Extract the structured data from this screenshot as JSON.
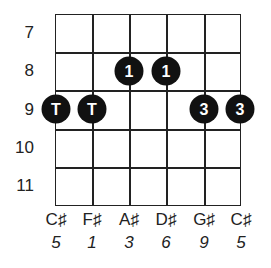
{
  "diagram": {
    "type": "guitar-chord-fretboard",
    "frets": [
      "7",
      "8",
      "9",
      "10",
      "11"
    ],
    "strings": [
      {
        "note": "C♯",
        "interval": "5"
      },
      {
        "note": "F♯",
        "interval": "1"
      },
      {
        "note": "A♯",
        "interval": "3"
      },
      {
        "note": "D♯",
        "interval": "6"
      },
      {
        "note": "G♯",
        "interval": "9"
      },
      {
        "note": "C♯",
        "interval": "5"
      }
    ],
    "dots": [
      {
        "string": 2,
        "fret": 8,
        "label": "1"
      },
      {
        "string": 3,
        "fret": 8,
        "label": "1"
      },
      {
        "string": 0,
        "fret": 9,
        "label": "T"
      },
      {
        "string": 1,
        "fret": 9,
        "label": "T"
      },
      {
        "string": 4,
        "fret": 9,
        "label": "3"
      },
      {
        "string": 5,
        "fret": 9,
        "label": "3"
      }
    ],
    "colors": {
      "dot": "#111111",
      "dot_text": "#ffffff",
      "lines": "#222222"
    }
  }
}
